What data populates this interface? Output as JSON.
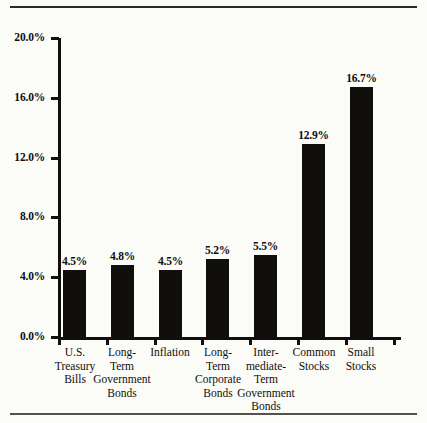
{
  "figure": {
    "background_color": "#fbfbf8",
    "ink_color": "#100f0d",
    "rule_top": true,
    "rule_bottom": true
  },
  "chart_data": {
    "type": "bar",
    "title": "",
    "subtitle": "",
    "xlabel": "",
    "ylabel": "",
    "ylim": [
      0,
      20
    ],
    "grid": false,
    "legend": "none",
    "axis": {
      "y_ticks": [
        "0.0%",
        "4.0%",
        "8.0%",
        "12.0%",
        "16.0%",
        "20.0%"
      ],
      "y_tick_values": [
        0,
        4,
        8,
        12,
        16,
        20
      ],
      "y_tick_suffix": "%",
      "x_tick_marks_between_categories": true
    },
    "categories": [
      "U.S. Treasury Bills",
      "Long-Term Government Bonds",
      "Inflation",
      "Long-Term Corporate Bonds",
      "Intermediate-Term Government Bonds",
      "Common Stocks",
      "Small Stocks"
    ],
    "category_label_lines": [
      [
        "U.S.",
        "Treasury",
        "Bills"
      ],
      [
        "Long-",
        "Term",
        "Government",
        "Bonds"
      ],
      [
        "Inflation"
      ],
      [
        "Long-",
        "Term",
        "Corporate",
        "Bonds"
      ],
      [
        "Inter-",
        "mediate-",
        "Term",
        "Government",
        "Bonds"
      ],
      [
        "Common",
        "Stocks"
      ],
      [
        "Small",
        "Stocks"
      ]
    ],
    "values": [
      4.5,
      4.8,
      4.5,
      5.2,
      5.5,
      12.9,
      16.7
    ],
    "data_labels": [
      "4.5%",
      "4.8%",
      "4.5%",
      "5.2%",
      "5.5%",
      "12.9%",
      "16.7%"
    ]
  }
}
